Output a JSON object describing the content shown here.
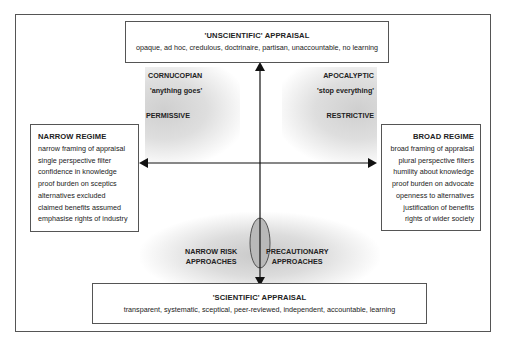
{
  "top_box": {
    "title": "'UNSCIENTIFIC' APPRAISAL",
    "description": "opaque, ad hoc, credulous, doctrinaire, partisan, unaccountable, no learning"
  },
  "bottom_box": {
    "title": "'SCIENTIFIC' APPRAISAL",
    "description": "transparent, systematic, sceptical, peer-reviewed, independent, accountable, learning"
  },
  "left_box": {
    "title": "NARROW REGIME",
    "items": [
      "narrow framing of appraisal",
      "single perspective filter",
      "confidence in knowledge",
      "proof burden on sceptics",
      "alternatives excluded",
      "claimed benefits assumed",
      "emphasise rights of industry"
    ]
  },
  "right_box": {
    "title": "BROAD REGIME",
    "items": [
      "broad framing of appraisal",
      "plural perspective filters",
      "humility about knowledge",
      "proof burden on advocate",
      "openness to alternatives",
      "justification  of benefits",
      "rights of wider society"
    ]
  },
  "quadrant_labels": {
    "top_left": {
      "title": "CORNUCOPIAN",
      "subtitle": "'anything goes'",
      "stance": "PERMISSIVE"
    },
    "top_right": {
      "title": "APOCALYPTIC",
      "subtitle": "'stop everything'",
      "stance": "RESTRICTIVE"
    },
    "bottom_left": {
      "line1": "NARROW RISK",
      "line2": "APPROACHES"
    },
    "bottom_right": {
      "line1": "PRECAUTIONARY",
      "line2": "APPROACHES"
    }
  },
  "colors": {
    "frame": "#555555",
    "shade": "#d6d6d6",
    "ellipse_fill": "#b8b8b8",
    "arrow": "#111111"
  }
}
